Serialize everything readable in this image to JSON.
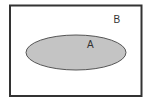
{
  "diagram": {
    "type": "venn",
    "universal_set": {
      "label": "B",
      "stroke_color": "#333333",
      "fill_color": "#ffffff"
    },
    "subset": {
      "label": "A",
      "stroke_color": "#555555",
      "fill_color": "#c4c4c4"
    }
  }
}
